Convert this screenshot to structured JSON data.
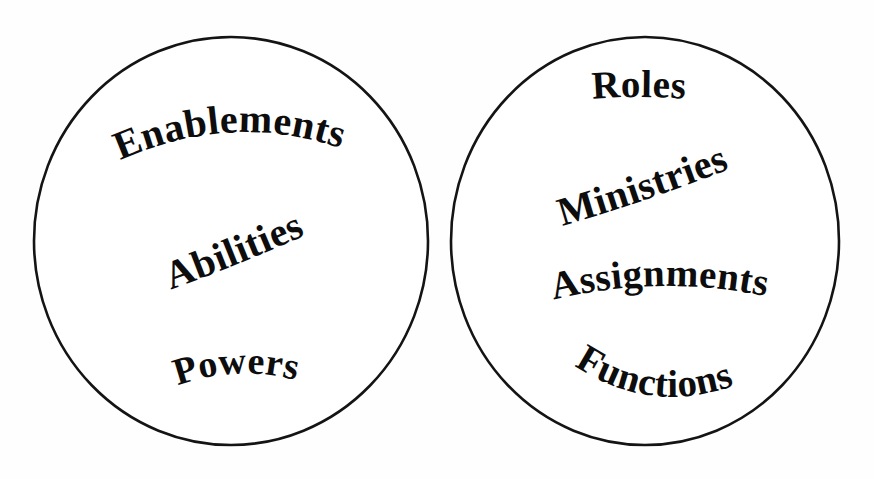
{
  "diagram": {
    "type": "two-circle-concept-diagram",
    "background_color": "#fefefe",
    "stroke_color": "#141414",
    "text_color": "#0d0d0d",
    "groups": [
      {
        "id": "left-circle",
        "name": "left-circle",
        "labels": [
          {
            "id": "enablements",
            "text": "Enablements",
            "font_size": 40
          },
          {
            "id": "abilities",
            "text": "Abilities",
            "font_size": 40
          },
          {
            "id": "powers",
            "text": "Powers",
            "font_size": 38
          }
        ]
      },
      {
        "id": "right-circle",
        "name": "right-circle",
        "labels": [
          {
            "id": "roles",
            "text": "Roles",
            "font_size": 39
          },
          {
            "id": "ministries",
            "text": "Ministries",
            "font_size": 40
          },
          {
            "id": "assignments",
            "text": "Assignments",
            "font_size": 39
          },
          {
            "id": "functions",
            "text": "Functions",
            "font_size": 39
          }
        ]
      }
    ]
  }
}
